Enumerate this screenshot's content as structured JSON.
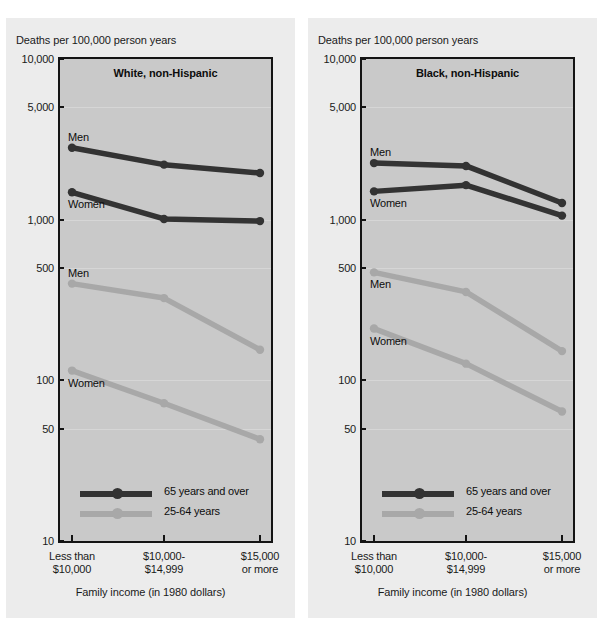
{
  "colors": {
    "page_background": "#ffffff",
    "panel_background": "#ececec",
    "plot_background": "#c9c9c9",
    "frame": "#141414",
    "series_65plus": "#333333",
    "series_25to64": "#a8a8a8",
    "gridline": "#d6d6d6",
    "text": "#1a1a1a"
  },
  "chart_data": [
    {
      "type": "line",
      "title": "White, non-Hispanic",
      "ylabel": "Deaths per 100,000 person years",
      "xlabel": "Family income (in 1980 dollars)",
      "yscale": "log",
      "ylim": [
        10,
        10000
      ],
      "ytick_labels": [
        "10,000",
        "5,000",
        "1,000",
        "500",
        "100",
        "50",
        "10"
      ],
      "ytick_values": [
        10000,
        5000,
        1000,
        500,
        100,
        50,
        10
      ],
      "grid": true,
      "legend_position": "inside-bottom-left",
      "categories": [
        "Less than $10,000",
        "$10,000-$14,999",
        "$15,000 or more"
      ],
      "category_lines": [
        [
          "Less than",
          "$10,000"
        ],
        [
          "$10,000-",
          "$14,999"
        ],
        [
          "$15,000",
          "or more"
        ]
      ],
      "series": [
        {
          "name": "Men",
          "group": "65 years and over",
          "color": "#333333",
          "label": "Men",
          "label_side": "above",
          "values": [
            2800,
            2200,
            1950
          ]
        },
        {
          "name": "Women",
          "group": "65 years and over",
          "color": "#333333",
          "label": "Women",
          "label_side": "below",
          "values": [
            1480,
            1010,
            980
          ]
        },
        {
          "name": "Men",
          "group": "25-64 years",
          "color": "#a8a8a8",
          "label": "Men",
          "label_side": "above",
          "values": [
            400,
            325,
            155
          ]
        },
        {
          "name": "Women",
          "group": "25-64 years",
          "color": "#a8a8a8",
          "label": "Women",
          "label_side": "below",
          "values": [
            115,
            72,
            43
          ]
        }
      ],
      "legend": [
        {
          "label": "65 years and over",
          "color": "#333333"
        },
        {
          "label": "25-64 years",
          "color": "#a8a8a8"
        }
      ]
    },
    {
      "type": "line",
      "title": "Black, non-Hispanic",
      "ylabel": "Deaths per 100,000 person years",
      "xlabel": "Family income (in 1980 dollars)",
      "yscale": "log",
      "ylim": [
        10,
        10000
      ],
      "ytick_labels": [
        "10,000",
        "5,000",
        "1,000",
        "500",
        "100",
        "50",
        "10"
      ],
      "ytick_values": [
        10000,
        5000,
        1000,
        500,
        100,
        50,
        10
      ],
      "grid": true,
      "legend_position": "inside-bottom-left",
      "categories": [
        "Less than $10,000",
        "$10,000-$14,999",
        "$15,000 or more"
      ],
      "category_lines": [
        [
          "Less than",
          "$10,000"
        ],
        [
          "$10,000-",
          "$14,999"
        ],
        [
          "$15,000",
          "or more"
        ]
      ],
      "series": [
        {
          "name": "Men",
          "group": "65 years and over",
          "color": "#333333",
          "label": "Men",
          "label_side": "above",
          "values": [
            2250,
            2160,
            1270
          ]
        },
        {
          "name": "Women",
          "group": "65 years and over",
          "color": "#333333",
          "label": "Women",
          "label_side": "below",
          "values": [
            1500,
            1640,
            1060
          ]
        },
        {
          "name": "Men",
          "group": "25-64 years",
          "color": "#a8a8a8",
          "label": "Men",
          "label_side": "below",
          "values": [
            470,
            355,
            152
          ]
        },
        {
          "name": "Women",
          "group": "25-64 years",
          "color": "#a8a8a8",
          "label": "Women",
          "label_side": "below",
          "values": [
            210,
            127,
            64
          ]
        }
      ],
      "legend": [
        {
          "label": "65 years and over",
          "color": "#333333"
        },
        {
          "label": "25-64 years",
          "color": "#a8a8a8"
        }
      ]
    }
  ]
}
